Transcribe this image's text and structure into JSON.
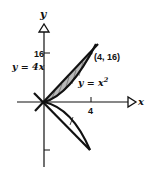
{
  "diagram": {
    "axes": {
      "x_label": "x",
      "y_label": "y",
      "x_tick_label": "4",
      "y_tick_label": "16"
    },
    "curves": [
      {
        "name": "line",
        "label": "y = 4x"
      },
      {
        "name": "parabola",
        "label_prefix": "y = x",
        "label_exponent": "2"
      }
    ],
    "intersection_label": "(4, 16)",
    "shaded_region": "between y = 4x and y = x^2 from x = 0 to x = 4",
    "colors": {
      "stroke": "#111111",
      "shade": "#b8b8b8"
    }
  }
}
